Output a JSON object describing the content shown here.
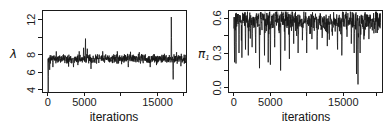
{
  "figure": {
    "background": "#ffffff",
    "axis_color": "#1a1a1a",
    "trace_color": "#161616",
    "overlay_color": "#a9a9a9"
  },
  "chart_data": [
    {
      "id": "lambda-trace-plot",
      "type": "line",
      "title": "",
      "xlabel": "iterations",
      "ylabel": "λ",
      "xlim": [
        -800,
        18900
      ],
      "ylim": [
        3.77,
        13.1
      ],
      "grid": false,
      "legend": null,
      "xticks": [
        {
          "v": 0,
          "label": "0"
        },
        {
          "v": 5000,
          "label": "5000"
        },
        {
          "v": 10000,
          "label": ""
        },
        {
          "v": 15000,
          "label": "15000"
        },
        {
          "v": 18600,
          "label": ""
        }
      ],
      "yticks": [
        {
          "v": 4,
          "label": "4"
        },
        {
          "v": 6,
          "label": "6"
        },
        {
          "v": 8,
          "label": "8"
        },
        {
          "v": 10,
          "label": ""
        },
        {
          "v": 12,
          "label": "12"
        }
      ],
      "series": [
        {
          "name": "lambda-trace",
          "color": "#161616",
          "width": 0.8,
          "seed": 11,
          "n": 820,
          "x_start": 0,
          "x_end": 18900,
          "baseline": 7.55,
          "jitter": 0.6,
          "outlier_prob": 0.07,
          "outlier_scale": 1.55,
          "outlier_mode": "sym",
          "clip_max": null,
          "anomalies": [
            {
              "x": 50,
              "y": 3.6
            },
            {
              "x": 250,
              "y": 6.3
            },
            {
              "x": 700,
              "y": 6.6
            },
            {
              "x": 3500,
              "y": 6.6
            },
            {
              "x": 4300,
              "y": 8.4
            },
            {
              "x": 4900,
              "y": 8.8
            },
            {
              "x": 5150,
              "y": 9.85
            },
            {
              "x": 5400,
              "y": 8.7
            },
            {
              "x": 5900,
              "y": 6.4
            },
            {
              "x": 7500,
              "y": 8.4
            },
            {
              "x": 9500,
              "y": 8.4
            },
            {
              "x": 11000,
              "y": 6.6
            },
            {
              "x": 12500,
              "y": 8.3
            },
            {
              "x": 14000,
              "y": 6.6
            },
            {
              "x": 16900,
              "y": 12.3
            },
            {
              "x": 17150,
              "y": 5.2
            },
            {
              "x": 17600,
              "y": 8.3
            },
            {
              "x": 18200,
              "y": 6.7
            }
          ]
        }
      ]
    },
    {
      "id": "pi-trace-plot",
      "type": "line",
      "title": "",
      "xlabel": "iterations",
      "ylabel": "π",
      "ylabel_sub": "1",
      "xlim": [
        -800,
        20300
      ],
      "ylim": [
        -0.035,
        0.67
      ],
      "grid": false,
      "legend": null,
      "xticks": [
        {
          "v": 0,
          "label": "0"
        },
        {
          "v": 5000,
          "label": "5000"
        },
        {
          "v": 10000,
          "label": ""
        },
        {
          "v": 15000,
          "label": "15000"
        },
        {
          "v": 19600,
          "label": ""
        }
      ],
      "yticks": [
        {
          "v": 0.0,
          "label": "0.0"
        },
        {
          "v": 0.15,
          "label": ""
        },
        {
          "v": 0.3,
          "label": "0.3"
        },
        {
          "v": 0.45,
          "label": ""
        },
        {
          "v": 0.6,
          "label": "0.6"
        }
      ],
      "series": [
        {
          "name": "pi-trace-overlay-gray",
          "color": "#a9a9a9",
          "width": 1.1,
          "seed": 5,
          "n": 180,
          "x_start": 3600,
          "x_end": 8400,
          "baseline": 0.62,
          "jitter": 0.05,
          "outlier_prob": 0.1,
          "outlier_scale": 1.3,
          "outlier_mode": "sym",
          "clip_max": 0.655,
          "anomalies": []
        },
        {
          "name": "pi-trace",
          "color": "#161616",
          "width": 0.8,
          "seed": 7,
          "n": 820,
          "x_start": 0,
          "x_end": 20100,
          "baseline": 0.59,
          "jitter": 0.085,
          "outlier_prob": 0.22,
          "outlier_scale": 0.13,
          "outlier_mode": "down",
          "clip_max": 0.655,
          "anomalies": [
            {
              "x": 100,
              "y": 0.22
            },
            {
              "x": 300,
              "y": 0.21
            },
            {
              "x": 700,
              "y": 0.3
            },
            {
              "x": 1100,
              "y": 0.26
            },
            {
              "x": 1600,
              "y": 0.33
            },
            {
              "x": 2000,
              "y": 0.28
            },
            {
              "x": 2500,
              "y": 0.35
            },
            {
              "x": 3000,
              "y": 0.3
            },
            {
              "x": 3500,
              "y": 0.17
            },
            {
              "x": 4200,
              "y": 0.28
            },
            {
              "x": 4700,
              "y": 0.22
            },
            {
              "x": 5000,
              "y": 0.2
            },
            {
              "x": 5600,
              "y": 0.35
            },
            {
              "x": 6400,
              "y": 0.15
            },
            {
              "x": 7000,
              "y": 0.32
            },
            {
              "x": 7600,
              "y": 0.25
            },
            {
              "x": 8200,
              "y": 0.38
            },
            {
              "x": 8800,
              "y": 0.3
            },
            {
              "x": 9400,
              "y": 0.41
            },
            {
              "x": 10000,
              "y": 0.3
            },
            {
              "x": 10700,
              "y": 0.42
            },
            {
              "x": 11400,
              "y": 0.33
            },
            {
              "x": 12100,
              "y": 0.43
            },
            {
              "x": 12800,
              "y": 0.36
            },
            {
              "x": 13500,
              "y": 0.45
            },
            {
              "x": 14200,
              "y": 0.33
            },
            {
              "x": 14800,
              "y": 0.28
            },
            {
              "x": 15500,
              "y": 0.44
            },
            {
              "x": 16100,
              "y": 0.38
            },
            {
              "x": 16500,
              "y": 0.3
            },
            {
              "x": 16800,
              "y": 0.12
            },
            {
              "x": 17000,
              "y": 0.03
            },
            {
              "x": 17300,
              "y": 0.3
            },
            {
              "x": 17900,
              "y": 0.45
            },
            {
              "x": 18500,
              "y": 0.42
            },
            {
              "x": 19200,
              "y": 0.47
            }
          ]
        }
      ]
    }
  ]
}
